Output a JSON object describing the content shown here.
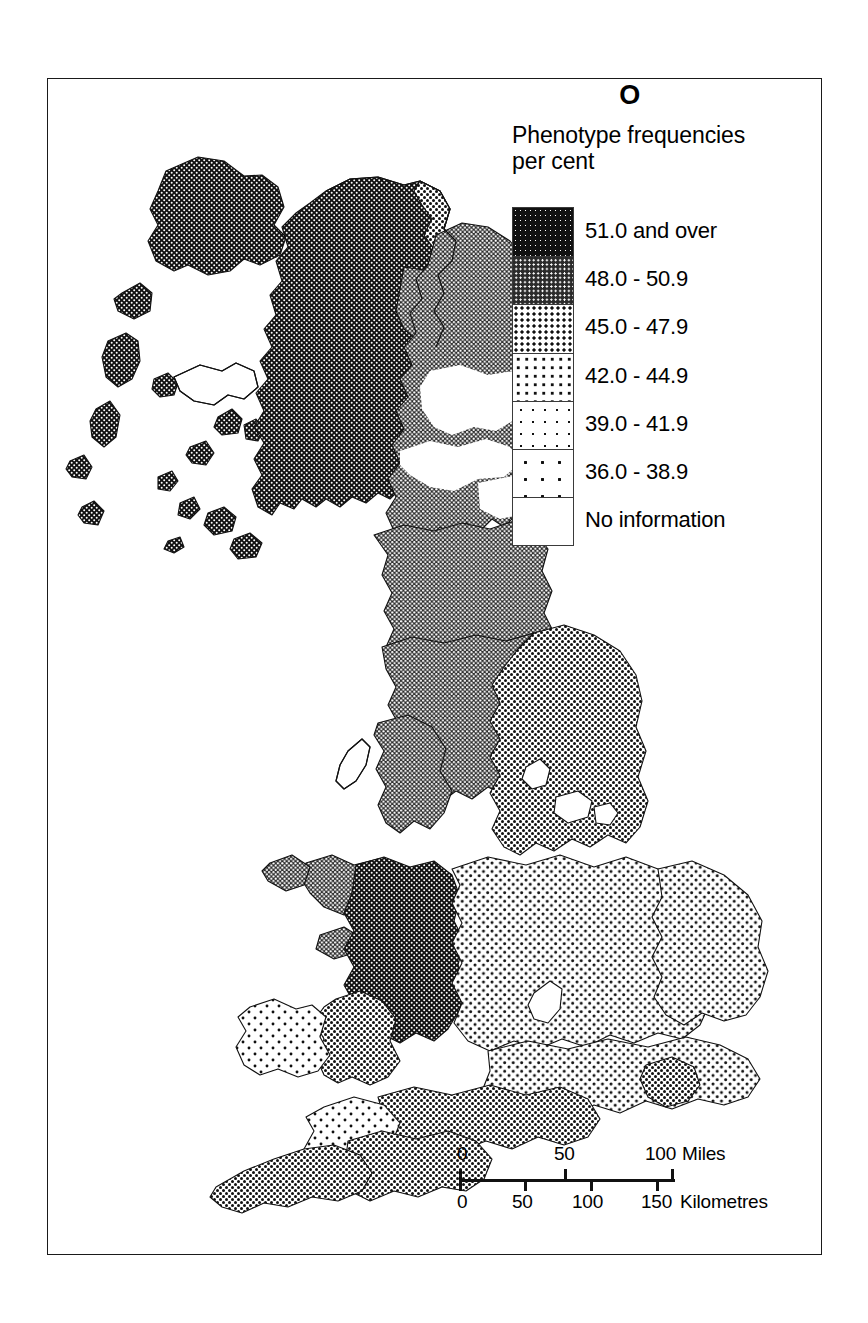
{
  "map": {
    "title": "O",
    "legend": {
      "heading": "Phenotype frequencies\nper cent",
      "classes": [
        {
          "label": "51.0 and over",
          "pattern": "densest-halftone",
          "range_min": 51.0,
          "range_max": null
        },
        {
          "label": "48.0 - 50.9",
          "pattern": "dense-halftone",
          "range_min": 48.0,
          "range_max": 50.9
        },
        {
          "label": "45.0 - 47.9",
          "pattern": "medium-dense-dots",
          "range_min": 45.0,
          "range_max": 47.9
        },
        {
          "label": "42.0 - 44.9",
          "pattern": "medium-dots",
          "range_min": 42.0,
          "range_max": 44.9
        },
        {
          "label": "39.0 - 41.9",
          "pattern": "sparse-dots",
          "range_min": 39.0,
          "range_max": 41.9
        },
        {
          "label": "36.0 - 38.9",
          "pattern": "sparsest-dots",
          "range_min": 36.0,
          "range_max": 38.9
        },
        {
          "label": "No information",
          "pattern": "blank",
          "range_min": null,
          "range_max": null
        }
      ]
    },
    "scale": {
      "miles": {
        "unit_label": "Miles",
        "ticks": [
          "0",
          "50",
          "100"
        ]
      },
      "kilometres": {
        "unit_label": "Kilometres",
        "ticks": [
          "0",
          "50",
          "100",
          "150"
        ]
      }
    },
    "regions": [
      {
        "name": "outer-hebrides",
        "class": "51.0 and over"
      },
      {
        "name": "northwest-highlands",
        "class": "51.0 and over"
      },
      {
        "name": "caithness",
        "class": "45.0 - 47.9"
      },
      {
        "name": "moray-firth-coast",
        "class": "48.0 - 50.9"
      },
      {
        "name": "northeast-scotland",
        "class": "48.0 - 50.9"
      },
      {
        "name": "central-scotland",
        "class": "48.0 - 50.9"
      },
      {
        "name": "southern-uplands",
        "class": "48.0 - 50.9"
      },
      {
        "name": "northern-england",
        "class": "48.0 - 50.9"
      },
      {
        "name": "yorkshire",
        "class": "45.0 - 47.9"
      },
      {
        "name": "north-wales",
        "class": "48.0 - 50.9"
      },
      {
        "name": "mid-wales",
        "class": "51.0 and over"
      },
      {
        "name": "southwest-wales",
        "class": "45.0 - 47.9"
      },
      {
        "name": "pembrokeshire",
        "class": "39.0 - 41.9"
      },
      {
        "name": "midlands",
        "class": "42.0 - 44.9"
      },
      {
        "name": "east-anglia",
        "class": "42.0 - 44.9"
      },
      {
        "name": "southeast-england",
        "class": "42.0 - 44.9"
      },
      {
        "name": "isle-of-wight",
        "class": "45.0 - 47.9"
      },
      {
        "name": "wessex",
        "class": "45.0 - 47.9"
      },
      {
        "name": "dorset",
        "class": "42.0 - 44.9"
      },
      {
        "name": "devon",
        "class": "45.0 - 47.9"
      },
      {
        "name": "cornwall",
        "class": "45.0 - 47.9"
      },
      {
        "name": "somerset",
        "class": "39.0 - 41.9"
      },
      {
        "name": "isle-of-man",
        "class": "No information"
      },
      {
        "name": "skye",
        "class": "No information"
      },
      {
        "name": "lake-district",
        "class": "No information"
      }
    ]
  }
}
